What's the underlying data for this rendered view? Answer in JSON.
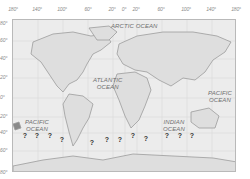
{
  "map": {
    "type": "world map",
    "longitude_labels": [
      "180°",
      "140°",
      "100°",
      "60°",
      "20°",
      "0°",
      "20°",
      "60°",
      "100°",
      "140°",
      "180°"
    ],
    "latitude_labels": [
      "80°",
      "60°",
      "40°",
      "20°",
      "0°",
      "20°",
      "40°",
      "60°",
      "80°"
    ],
    "oceans": [
      {
        "name": "ARCTIC OCEAN",
        "lines": [
          "ARCTIC OCEAN"
        ]
      },
      {
        "name": "ATLANTIC OCEAN",
        "lines": [
          "ATLANTIC",
          "OCEAN"
        ]
      },
      {
        "name": "PACIFIC OCEAN west",
        "lines": [
          "PACIFIC",
          "OCEAN"
        ]
      },
      {
        "name": "INDIAN OCEAN",
        "lines": [
          "INDIAN",
          "OCEAN"
        ]
      },
      {
        "name": "PACIFIC OCEAN east",
        "lines": [
          "PACIFIC",
          "OCEAN"
        ]
      }
    ],
    "question_marks": [
      "?",
      "?",
      "?",
      "?",
      "?",
      "?",
      "?",
      "?",
      "?",
      "?",
      "?",
      "?"
    ],
    "colors": {
      "land": "#dedede",
      "sea": "#ececec",
      "coast": "#9c9c9c",
      "grid": "#d2d2d2",
      "marker": "#333333"
    }
  }
}
